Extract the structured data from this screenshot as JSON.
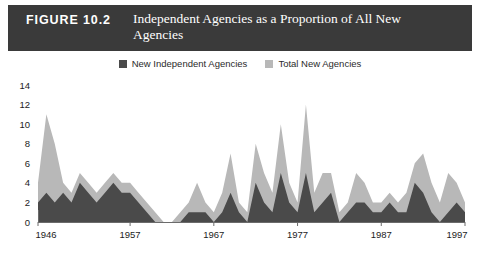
{
  "figure": {
    "number": "FIGURE 10.2",
    "title": "Independent Agencies as a Proportion of All New Agencies"
  },
  "colors": {
    "header_bar": "#3a3a3a",
    "header_text": "#ffffff",
    "total_new_agencies": "#b8b8b8",
    "new_independent_agencies": "#4a4a4a",
    "axis": "#6b6b6b",
    "tick_text": "#1c1c1c",
    "background": "#ffffff"
  },
  "legend": {
    "position": "top-center",
    "entries": [
      {
        "label": "New Independent Agencies",
        "color": "#4a4a4a"
      },
      {
        "label": "Total New Agencies",
        "color": "#b8b8b8"
      }
    ]
  },
  "chart_data": {
    "type": "area",
    "title": "Independent Agencies as a Proportion of All New Agencies",
    "xlabel": "",
    "ylabel": "",
    "grid": false,
    "legend_position": "top-center",
    "xlim": [
      1946,
      1997
    ],
    "ylim": [
      0,
      14
    ],
    "yticks": [
      0,
      2,
      4,
      6,
      8,
      10,
      12,
      14
    ],
    "ytick_labels": [
      "0",
      "2",
      "4",
      "6",
      "8",
      "10",
      "12",
      "14"
    ],
    "xticks": [
      1946,
      1957,
      1967,
      1977,
      1987,
      1997
    ],
    "xtick_labels": [
      "1946",
      "1957",
      "1967",
      "1977",
      "1987",
      "1997"
    ],
    "x": [
      1946,
      1947,
      1948,
      1949,
      1950,
      1951,
      1952,
      1953,
      1954,
      1955,
      1956,
      1957,
      1958,
      1959,
      1960,
      1961,
      1962,
      1963,
      1964,
      1965,
      1966,
      1967,
      1968,
      1969,
      1970,
      1971,
      1972,
      1973,
      1974,
      1975,
      1976,
      1977,
      1978,
      1979,
      1980,
      1981,
      1982,
      1983,
      1984,
      1985,
      1986,
      1987,
      1988,
      1989,
      1990,
      1991,
      1992,
      1993,
      1994,
      1995,
      1996,
      1997
    ],
    "series": [
      {
        "name": "Total New Agencies",
        "color": "#b8b8b8",
        "values": [
          4,
          11,
          8,
          4,
          3,
          5,
          4,
          3,
          4,
          5,
          4,
          4,
          3,
          2,
          1,
          0,
          0,
          1,
          2,
          4,
          2,
          1,
          3,
          7,
          2,
          1,
          8,
          5,
          3,
          10,
          4,
          2,
          12,
          3,
          5,
          5,
          1,
          2,
          5,
          4,
          2,
          2,
          3,
          2,
          3,
          6,
          7,
          4,
          2,
          5,
          4,
          2
        ]
      },
      {
        "name": "New Independent Agencies",
        "color": "#4a4a4a",
        "values": [
          2,
          3,
          2,
          3,
          2,
          4,
          3,
          2,
          3,
          4,
          3,
          3,
          2,
          1,
          0,
          0,
          0,
          0,
          1,
          1,
          1,
          0,
          1,
          3,
          1,
          0,
          4,
          2,
          1,
          5,
          2,
          1,
          5,
          1,
          2,
          3,
          0,
          1,
          2,
          2,
          1,
          1,
          2,
          1,
          1,
          4,
          3,
          1,
          0,
          1,
          2,
          1
        ]
      }
    ]
  }
}
